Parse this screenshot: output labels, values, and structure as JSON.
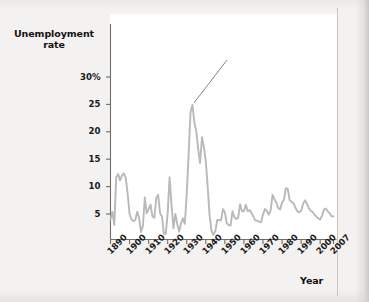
{
  "chart_data": {
    "type": "line",
    "title": "",
    "xlabel": "Year",
    "ylabel": "Unemployment rate",
    "xlim": [
      1890,
      2007
    ],
    "ylim": [
      0,
      32
    ],
    "grid": false,
    "legend": "none",
    "y_ticks": [
      {
        "value": 30,
        "label": "30%"
      },
      {
        "value": 25,
        "label": "25"
      },
      {
        "value": 20,
        "label": "20"
      },
      {
        "value": 15,
        "label": "15"
      },
      {
        "value": 10,
        "label": "10"
      },
      {
        "value": 5,
        "label": "5"
      }
    ],
    "x_ticks": [
      {
        "value": 1890,
        "label": "1890"
      },
      {
        "value": 1900,
        "label": "1900"
      },
      {
        "value": 1910,
        "label": "1910"
      },
      {
        "value": 1920,
        "label": "1920"
      },
      {
        "value": 1930,
        "label": "1930"
      },
      {
        "value": 1940,
        "label": "1940"
      },
      {
        "value": 1950,
        "label": "1950"
      },
      {
        "value": 1960,
        "label": "1960"
      },
      {
        "value": 1970,
        "label": "1970"
      },
      {
        "value": 1980,
        "label": "1980"
      },
      {
        "value": 1990,
        "label": "1990"
      },
      {
        "value": 2000,
        "label": "2000"
      },
      {
        "value": 2007,
        "label": "2007"
      }
    ],
    "series": [
      {
        "name": "Unemployment rate",
        "color": "#b9b9b9",
        "x": [
          1890,
          1891,
          1892,
          1893,
          1894,
          1895,
          1896,
          1897,
          1898,
          1899,
          1900,
          1901,
          1902,
          1903,
          1904,
          1905,
          1906,
          1907,
          1908,
          1909,
          1910,
          1911,
          1912,
          1913,
          1914,
          1915,
          1916,
          1917,
          1918,
          1919,
          1920,
          1921,
          1922,
          1923,
          1924,
          1925,
          1926,
          1927,
          1928,
          1929,
          1930,
          1931,
          1932,
          1933,
          1934,
          1935,
          1936,
          1937,
          1938,
          1939,
          1940,
          1941,
          1942,
          1943,
          1944,
          1945,
          1946,
          1947,
          1948,
          1949,
          1950,
          1951,
          1952,
          1953,
          1954,
          1955,
          1956,
          1957,
          1958,
          1959,
          1960,
          1961,
          1962,
          1963,
          1964,
          1965,
          1966,
          1967,
          1968,
          1969,
          1970,
          1971,
          1972,
          1973,
          1974,
          1975,
          1976,
          1977,
          1978,
          1979,
          1980,
          1981,
          1982,
          1983,
          1984,
          1985,
          1986,
          1987,
          1988,
          1989,
          1990,
          1991,
          1992,
          1993,
          1994,
          1995,
          1996,
          1997,
          1998,
          1999,
          2000,
          2001,
          2002,
          2003,
          2004,
          2005,
          2006,
          2007
        ],
        "values": [
          4.0,
          5.4,
          3.0,
          11.7,
          12.3,
          11.1,
          12.0,
          12.4,
          11.6,
          8.7,
          5.0,
          4.0,
          3.7,
          3.9,
          5.4,
          4.3,
          1.7,
          2.8,
          8.0,
          5.1,
          5.9,
          6.7,
          4.6,
          4.3,
          7.9,
          8.5,
          5.1,
          4.6,
          1.4,
          1.4,
          5.2,
          11.7,
          6.7,
          2.4,
          5.0,
          3.2,
          1.8,
          3.3,
          4.2,
          3.2,
          8.7,
          15.9,
          23.6,
          24.9,
          21.7,
          20.1,
          16.9,
          14.3,
          19.0,
          17.2,
          14.6,
          9.9,
          4.7,
          1.9,
          1.2,
          1.9,
          3.9,
          3.9,
          3.8,
          5.9,
          5.3,
          3.3,
          3.0,
          2.9,
          5.5,
          4.4,
          4.1,
          4.3,
          6.8,
          5.5,
          5.5,
          6.7,
          5.5,
          5.7,
          5.2,
          4.5,
          3.8,
          3.8,
          3.6,
          3.5,
          4.9,
          5.9,
          5.6,
          4.9,
          5.6,
          8.5,
          7.7,
          7.1,
          6.1,
          5.8,
          7.1,
          7.6,
          9.7,
          9.6,
          7.5,
          7.2,
          7.0,
          6.2,
          5.5,
          5.3,
          5.6,
          6.8,
          7.5,
          6.9,
          6.1,
          5.6,
          5.4,
          4.9,
          4.5,
          4.2,
          4.0,
          4.7,
          5.8,
          6.0,
          5.5,
          5.1,
          4.6,
          4.6
        ]
      }
    ],
    "annotations": [
      {
        "name": "great-depression-callout",
        "line1": "Great Depression",
        "line2": "(1929–1941)",
        "points_to_year": 1933,
        "points_to_value": 24.9
      }
    ]
  }
}
